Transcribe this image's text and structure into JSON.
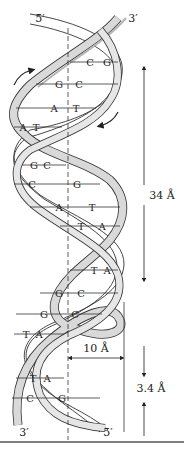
{
  "figure": {
    "strand_ends": {
      "top_left": "5′",
      "top_right": "3′",
      "bottom_left": "3′",
      "bottom_right": "5′"
    },
    "base_pairs": [
      {
        "left": "C",
        "right": "G"
      },
      {
        "left": "G",
        "right": "C"
      },
      {
        "left": "A",
        "right": "T"
      },
      {
        "left": "A",
        "right": "T"
      },
      {
        "left": "G",
        "right": "C"
      },
      {
        "left": "C",
        "right": "G"
      },
      {
        "left": "A",
        "right": "T"
      },
      {
        "left": "T",
        "right": "A"
      },
      {
        "left": "T",
        "right": "A"
      },
      {
        "left": "G",
        "right": "C"
      },
      {
        "left": "G",
        "right": "C"
      },
      {
        "left": "T",
        "right": "A"
      },
      {
        "left": "T",
        "right": "A"
      },
      {
        "left": "C",
        "right": "G"
      }
    ],
    "measurements": {
      "pitch": "34 Å",
      "diameter": "10 Å",
      "rise": "3.4 Å"
    },
    "colors": {
      "ribbon_fill": "#d9d9d9",
      "ribbon_shade": "#b5b5b5",
      "line": "#333333",
      "background": "#ffffff"
    }
  }
}
